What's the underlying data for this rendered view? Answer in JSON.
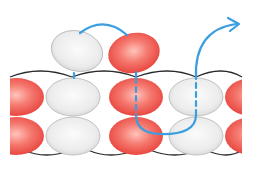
{
  "diagram": {
    "type": "beadwork-thread-path",
    "colors": {
      "red_bead": "#ee4a45",
      "red_bead_light": "#ffb3ab",
      "white_bead": "#dedede",
      "white_bead_light": "#fafafa",
      "bead_outline": "#b9b9b9",
      "thread_black": "#222222",
      "thread_path": "#3a9ee0"
    },
    "top_beads": [
      {
        "color": "white",
        "cx": 77,
        "cy": 51
      },
      {
        "color": "red",
        "cx": 134,
        "cy": 53
      }
    ],
    "grid_rows": [
      {
        "row": 1,
        "beads": [
          "red",
          "white",
          "red",
          "white",
          "red"
        ]
      },
      {
        "row": 2,
        "beads": [
          "red",
          "white",
          "red",
          "white",
          "red"
        ]
      }
    ],
    "arrow_direction": "up-right"
  }
}
